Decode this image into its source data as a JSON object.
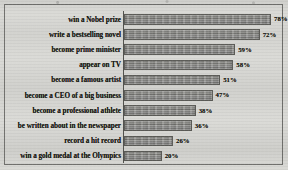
{
  "chart_data": {
    "type": "bar",
    "orientation": "horizontal",
    "title": "",
    "xlabel": "",
    "ylabel": "",
    "xlim": [
      0,
      80
    ],
    "grid": false,
    "legend": null,
    "value_suffix": "%",
    "categories": [
      "win a Nobel prize",
      "write a bestselling novel",
      "become prime minister",
      "appear on TV",
      "become a famous artist",
      "become a CEO of a big business",
      "become a professional athlete",
      "be written about in the newspaper",
      "record a hit record",
      "win a gold medal at the Olympics"
    ],
    "values": [
      78,
      72,
      59,
      58,
      51,
      47,
      38,
      36,
      26,
      20
    ],
    "value_labels": [
      "78%",
      "72%",
      "59%",
      "58%",
      "51%",
      "47%",
      "38%",
      "36%",
      "26%",
      "20%"
    ],
    "bar_color": "#8f8f8c",
    "bar_border_color": "#5b5b57",
    "axis_color": "#53534f",
    "frame_color": "#6f6f6c",
    "label_color": "#15150f",
    "background_color": "#d9d9d5"
  }
}
